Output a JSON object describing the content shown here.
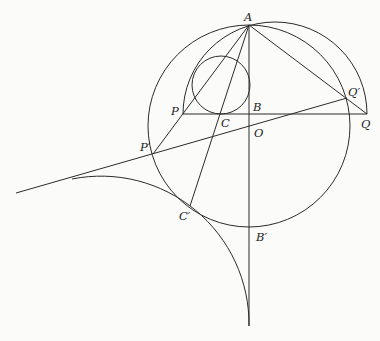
{
  "figure": {
    "width": 380,
    "height": 341,
    "background": "#fbfbfa",
    "stroke_color": "#2b2b2b",
    "label_color": "#1e1e1e"
  },
  "points": {
    "A": {
      "label": "A",
      "x": 249,
      "y": 25,
      "lx": 244,
      "ly": 21
    },
    "P": {
      "label": "P",
      "x": 183,
      "y": 114,
      "lx": 171,
      "ly": 115
    },
    "C": {
      "label": "C",
      "x": 221,
      "y": 114,
      "lx": 221,
      "ly": 127
    },
    "B": {
      "label": "B",
      "x": 249,
      "y": 114,
      "lx": 253,
      "ly": 111
    },
    "Q": {
      "label": "Q",
      "x": 367,
      "y": 114,
      "lx": 361,
      "ly": 128
    },
    "Qp": {
      "label": "Q′",
      "x": 347,
      "y": 98,
      "lx": 348,
      "ly": 96
    },
    "O": {
      "label": "O",
      "x": 249,
      "y": 126,
      "lx": 254,
      "ly": 137
    },
    "Pp": {
      "label": "P′",
      "x": 153,
      "y": 154,
      "lx": 140,
      "ly": 151
    },
    "Cp": {
      "label": "C′",
      "x": 190,
      "y": 206,
      "lx": 179,
      "ly": 220
    },
    "Bp": {
      "label": "B′",
      "x": 249,
      "y": 227,
      "lx": 256,
      "ly": 241
    }
  },
  "circles": {
    "main": {
      "name": "circle-O",
      "cx": 249,
      "cy": 126,
      "r": 101
    },
    "incircle": {
      "name": "incircle",
      "cx": 221,
      "cy": 85,
      "r": 29
    }
  },
  "arcs": {
    "semicircle_PQ": {
      "name": "semicircle-on-PQ",
      "cx": 275,
      "cy": 114,
      "r": 92
    },
    "tangent_arc": {
      "name": "tangent-arc",
      "cx": 101.5,
      "cy": 326,
      "r": 148,
      "start": [
        72,
        179
      ],
      "end": [
        249,
        326
      ]
    }
  },
  "segments": [
    {
      "name": "segment-PQ",
      "from": [
        183,
        114
      ],
      "to": [
        367,
        114
      ]
    },
    {
      "name": "segment-AB-vertical",
      "from": [
        249,
        25
      ],
      "to": [
        249,
        326
      ]
    },
    {
      "name": "segment-AP-prime",
      "from": [
        249,
        25
      ],
      "to": [
        153,
        154
      ]
    },
    {
      "name": "segment-AC-prime",
      "from": [
        249,
        25
      ],
      "to": [
        190,
        206
      ]
    },
    {
      "name": "segment-AQ",
      "from": [
        249,
        25
      ],
      "to": [
        367,
        114
      ]
    },
    {
      "name": "line-P-prime-Q-prime",
      "from": [
        16,
        193
      ],
      "to": [
        347,
        98
      ]
    }
  ]
}
